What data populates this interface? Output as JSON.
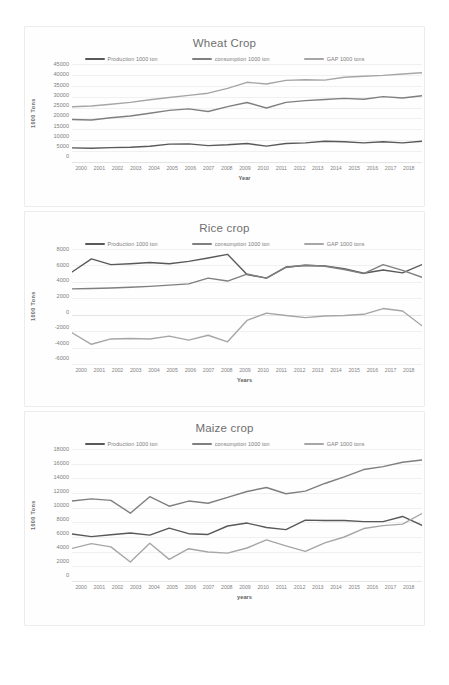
{
  "document": {
    "background_color": "#ffffff",
    "card_border_color": "#ececec"
  },
  "palette": {
    "production": "#595959",
    "consumption": "#7f7f7f",
    "gap": "#a6a6a6",
    "gridline": "#f0f0f0",
    "title_text": "#6f6f6f",
    "tick_text": "#808080"
  },
  "legend": {
    "production_label": "Production 1000 ton",
    "consumption_label": "consumption 1000 ton",
    "gap_label": "GAP 1000 tons"
  },
  "charts": [
    {
      "key": "wheat",
      "title": "Wheat Crop",
      "xlabel": "Year",
      "ylabel": "1000 Tons"
    },
    {
      "key": "rice",
      "title": "Rice crop",
      "xlabel": "Years",
      "ylabel": "1000 Tons"
    },
    {
      "key": "maize",
      "title": "Maize crop",
      "xlabel": "years",
      "ylabel": "1000 Tons"
    }
  ],
  "chart_data": [
    {
      "type": "line",
      "key": "wheat",
      "title": "Wheat Crop",
      "xlabel": "Year",
      "ylabel": "1000 Tons",
      "grid": true,
      "legend_position": "top",
      "x": [
        2000,
        2001,
        2002,
        2003,
        2004,
        2005,
        2006,
        2007,
        2008,
        2009,
        2010,
        2011,
        2012,
        2013,
        2014,
        2015,
        2016,
        2017,
        2018
      ],
      "categories": [
        "2000",
        "2001",
        "2002",
        "2003",
        "2004",
        "2005",
        "2006",
        "2007",
        "2008",
        "2009",
        "2010",
        "2011",
        "2012",
        "2013",
        "2014",
        "2015",
        "2016",
        "2017",
        "2018"
      ],
      "ylim": [
        0,
        45000
      ],
      "yticks": [
        0,
        5000,
        10000,
        15000,
        20000,
        25000,
        30000,
        35000,
        40000,
        45000
      ],
      "ytick_labels": [
        "0",
        "5000",
        "10000",
        "15000",
        "20000",
        "25000",
        "30000",
        "35000",
        "40000",
        "45000"
      ],
      "series": [
        {
          "name": "Production 1000 ton",
          "color": "#595959",
          "values": [
            6500,
            6300,
            6600,
            6800,
            7200,
            8200,
            8300,
            7500,
            7900,
            8500,
            7300,
            8500,
            8800,
            9500,
            9300,
            8800,
            9300,
            8800,
            9500
          ]
        },
        {
          "name": "consumption 1000 ton",
          "color": "#7f7f7f",
          "values": [
            19500,
            19300,
            20300,
            21100,
            22400,
            23700,
            24400,
            23200,
            25400,
            27300,
            24800,
            27400,
            28200,
            28700,
            29200,
            28800,
            30000,
            29400,
            30400
          ]
        },
        {
          "name": "GAP 1000 tons",
          "color": "#a6a6a6",
          "values": [
            25400,
            25700,
            26500,
            27400,
            28600,
            29600,
            30600,
            31600,
            33800,
            36600,
            35800,
            37500,
            37800,
            37600,
            38900,
            39400,
            39800,
            40400,
            41000
          ]
        }
      ]
    },
    {
      "type": "line",
      "key": "rice",
      "title": "Rice crop",
      "xlabel": "Years",
      "ylabel": "1000 Tons",
      "grid": true,
      "legend_position": "top",
      "x": [
        2000,
        2001,
        2002,
        2003,
        2004,
        2005,
        2006,
        2007,
        2008,
        2009,
        2010,
        2011,
        2012,
        2013,
        2014,
        2015,
        2016,
        2017,
        2018
      ],
      "categories": [
        "2000",
        "2001",
        "2002",
        "2003",
        "2004",
        "2005",
        "2006",
        "2007",
        "2008",
        "2009",
        "2010",
        "2011",
        "2012",
        "2013",
        "2014",
        "2015",
        "2016",
        "2017",
        "2018"
      ],
      "ylim": [
        -6000,
        8000
      ],
      "yticks": [
        -6000,
        -4000,
        -2000,
        0,
        2000,
        4000,
        6000,
        8000
      ],
      "ytick_labels": [
        "-6000",
        "-4000",
        "-2000",
        "0",
        "2000",
        "4000",
        "6000",
        "8000"
      ],
      "series": [
        {
          "name": "Production 1000 ton",
          "color": "#595959",
          "values": [
            5200,
            6800,
            6100,
            6200,
            6350,
            6200,
            6500,
            6900,
            7350,
            4900,
            4450,
            5800,
            6000,
            5950,
            5600,
            5050,
            5450,
            5100,
            6100
          ]
        },
        {
          "name": "consumption 1000 ton",
          "color": "#7f7f7f",
          "values": [
            3150,
            3200,
            3250,
            3350,
            3450,
            3600,
            3750,
            4450,
            4100,
            4950,
            4450,
            5750,
            6050,
            5900,
            5500,
            5000,
            6100,
            5400,
            4550
          ]
        },
        {
          "name": "GAP 1000 tons",
          "color": "#a6a6a6",
          "values": [
            -2200,
            -3600,
            -2950,
            -2900,
            -2950,
            -2600,
            -3100,
            -2500,
            -3300,
            -700,
            200,
            -100,
            -350,
            -150,
            -100,
            50,
            750,
            450,
            -1350
          ]
        }
      ]
    },
    {
      "type": "line",
      "key": "maize",
      "title": "Maize crop",
      "xlabel": "years",
      "ylabel": "1000 Tons",
      "grid": true,
      "legend_position": "top",
      "x": [
        2000,
        2001,
        2002,
        2003,
        2004,
        2005,
        2006,
        2007,
        2008,
        2009,
        2010,
        2011,
        2012,
        2013,
        2014,
        2015,
        2016,
        2017,
        2018
      ],
      "categories": [
        "2000",
        "2001",
        "2002",
        "2003",
        "2004",
        "2005",
        "2006",
        "2007",
        "2008",
        "2009",
        "2010",
        "2011",
        "2012",
        "2013",
        "2014",
        "2015",
        "2016",
        "2017",
        "2018"
      ],
      "ylim": [
        0,
        18000
      ],
      "yticks": [
        0,
        2000,
        4000,
        6000,
        8000,
        10000,
        12000,
        14000,
        16000,
        18000
      ],
      "ytick_labels": [
        "0",
        "2000",
        "4000",
        "6000",
        "8000",
        "10000",
        "12000",
        "14000",
        "16000",
        "18000"
      ],
      "series": [
        {
          "name": "Production 1000 ton",
          "color": "#595959",
          "values": [
            6400,
            6050,
            6300,
            6550,
            6250,
            7200,
            6450,
            6350,
            7500,
            7900,
            7300,
            7000,
            8300,
            8250,
            8250,
            8100,
            8100,
            8800,
            7600
          ]
        },
        {
          "name": "consumption 1000 ton",
          "color": "#7f7f7f",
          "values": [
            10900,
            11200,
            11000,
            9250,
            11500,
            10200,
            10900,
            10600,
            11400,
            12200,
            12750,
            11900,
            12250,
            13300,
            14200,
            15200,
            15600,
            16200,
            16500
          ]
        },
        {
          "name": "GAP 1000 tons",
          "color": "#a6a6a6",
          "values": [
            4450,
            5100,
            4650,
            2600,
            5150,
            2950,
            4400,
            3950,
            3800,
            4500,
            5600,
            4800,
            4050,
            5200,
            6000,
            7150,
            7550,
            7750,
            9200
          ]
        }
      ]
    }
  ]
}
